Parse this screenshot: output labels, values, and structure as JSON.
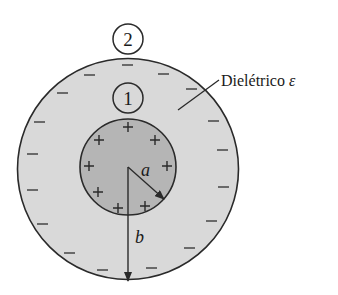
{
  "diagram": {
    "labels": {
      "region_outer": "2",
      "region_inner": "1",
      "dielectric": "Dielétrico ",
      "epsilon": "ε",
      "radius_inner": "a",
      "radius_outer": "b"
    },
    "charges": {
      "inner_sign": "+",
      "outer_sign": "−"
    },
    "colors": {
      "outer_fill": "#d9d9d9",
      "inner_fill": "#b5b5b5",
      "stroke": "#2a2a2a",
      "background": "#ffffff"
    }
  }
}
